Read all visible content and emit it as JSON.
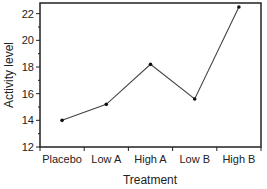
{
  "chart_data": {
    "type": "line",
    "title": "",
    "xlabel": "Treatment",
    "ylabel": "Activity level",
    "categories": [
      "Placebo",
      "Low A",
      "High A",
      "Low B",
      "High B"
    ],
    "values": [
      14.0,
      15.2,
      18.2,
      15.6,
      22.5
    ],
    "ylim": [
      12,
      22.8
    ],
    "yticks": [
      12,
      14,
      16,
      18,
      20,
      22
    ],
    "y_minor_ticks": [
      13,
      15,
      17,
      19,
      21
    ],
    "grid": false,
    "legend": null,
    "markers": true,
    "colors": {
      "line": "#444444",
      "marker": "#111111",
      "axis": "#222222"
    }
  }
}
